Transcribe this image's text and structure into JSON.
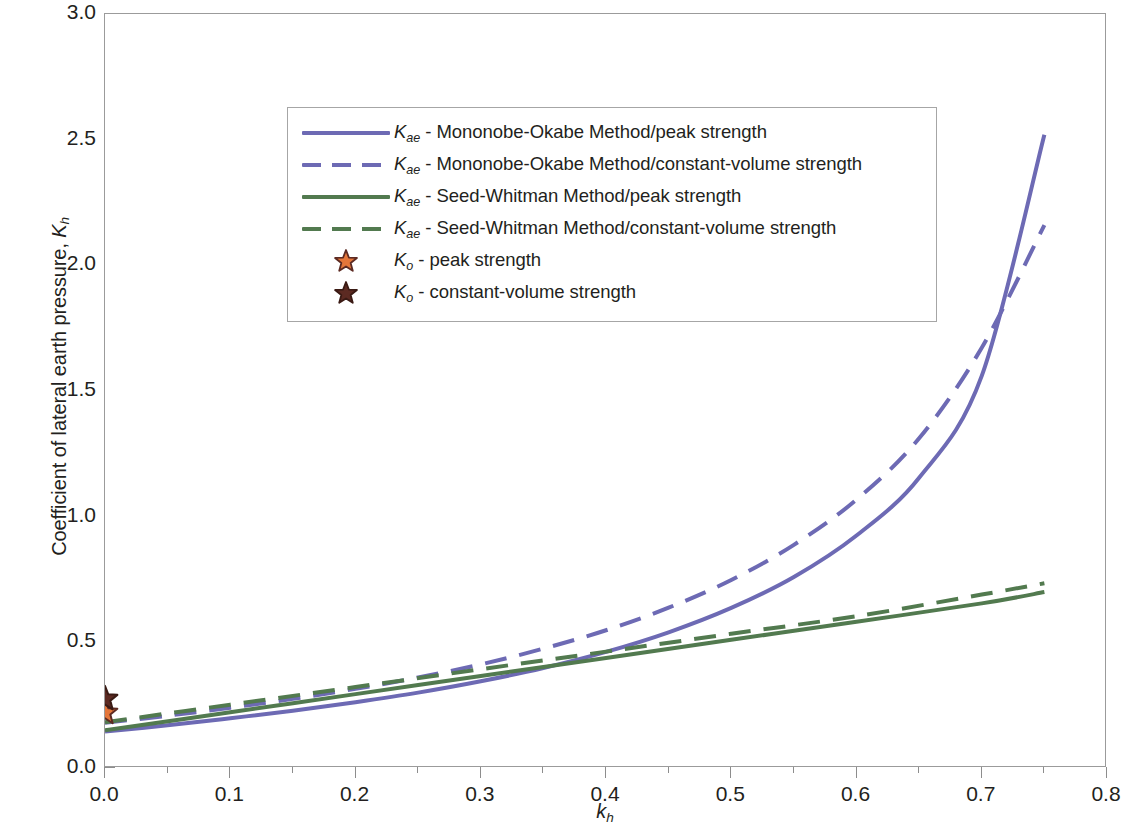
{
  "chart_data": {
    "type": "line",
    "title": "",
    "xlabel": "k_h",
    "ylabel": "Coefficient of lateral earth pressure, K_h",
    "xlim": [
      0.0,
      0.8
    ],
    "ylim": [
      0.0,
      3.0
    ],
    "x_ticks": [
      "0.0",
      "0.1",
      "0.2",
      "0.3",
      "0.4",
      "0.5",
      "0.6",
      "0.7",
      "0.8"
    ],
    "x_tick_values": [
      0.0,
      0.1,
      0.2,
      0.3,
      0.4,
      0.5,
      0.6,
      0.7,
      0.8
    ],
    "x_minor_step": 0.05,
    "y_ticks": [
      "0.0",
      "0.5",
      "1.0",
      "1.5",
      "2.0",
      "2.5",
      "3.0"
    ],
    "y_tick_values": [
      0.0,
      0.5,
      1.0,
      1.5,
      2.0,
      2.5,
      3.0
    ],
    "y_minor_step": 0.1,
    "grid": false,
    "legend_position": "upper-left-inside",
    "series": [
      {
        "name": "Kae - Mononobe-Okabe Method/peak strength",
        "style": "solid",
        "color": "#6d6ab4",
        "x": [
          0.0,
          0.05,
          0.1,
          0.15,
          0.2,
          0.25,
          0.3,
          0.35,
          0.4,
          0.45,
          0.5,
          0.55,
          0.6,
          0.65,
          0.7,
          0.75
        ],
        "y": [
          0.145,
          0.17,
          0.198,
          0.228,
          0.262,
          0.3,
          0.345,
          0.398,
          0.462,
          0.54,
          0.637,
          0.76,
          0.925,
          1.155,
          1.56,
          2.52
        ]
      },
      {
        "name": "Kae - Mononobe-Okabe Method/constant-volume strength",
        "style": "dashed",
        "color": "#6d6ab4",
        "x": [
          0.0,
          0.05,
          0.1,
          0.15,
          0.2,
          0.25,
          0.3,
          0.35,
          0.4,
          0.45,
          0.5,
          0.55,
          0.6,
          0.65,
          0.7,
          0.75
        ],
        "y": [
          0.18,
          0.208,
          0.24,
          0.275,
          0.315,
          0.36,
          0.412,
          0.475,
          0.548,
          0.638,
          0.748,
          0.888,
          1.068,
          1.312,
          1.672,
          2.16
        ]
      },
      {
        "name": "Kae - Seed-Whitman Method/peak strength",
        "style": "solid",
        "color": "#527a4f",
        "x": [
          0.0,
          0.1,
          0.2,
          0.3,
          0.4,
          0.5,
          0.6,
          0.7,
          0.75
        ],
        "y": [
          0.15,
          0.222,
          0.294,
          0.366,
          0.438,
          0.51,
          0.582,
          0.655,
          0.7
        ]
      },
      {
        "name": "Kae - Seed-Whitman Method/constant-volume strength",
        "style": "dashed",
        "color": "#527a4f",
        "x": [
          0.0,
          0.1,
          0.2,
          0.3,
          0.4,
          0.5,
          0.6,
          0.7,
          0.75
        ],
        "y": [
          0.182,
          0.252,
          0.322,
          0.393,
          0.463,
          0.534,
          0.604,
          0.69,
          0.735
        ]
      }
    ],
    "points": [
      {
        "name": "Ko - peak strength",
        "marker": "star",
        "fill": "#e4763a",
        "stroke": "#5c2a22",
        "x": 0.0,
        "y": 0.22
      },
      {
        "name": "Ko - constant-volume strength",
        "marker": "star",
        "fill": "#5c2a22",
        "stroke": "#3a1a14",
        "x": 0.0,
        "y": 0.275
      }
    ]
  },
  "axes": {
    "ylabel_prefix": "Coefficient of lateral earth pressure, ",
    "ylabel_symbol": "K",
    "ylabel_sub": "h",
    "xlabel_symbol": "k",
    "xlabel_sub": "h"
  },
  "legend": {
    "items": [
      {
        "sample": "line-solid-blue",
        "symbol": "K",
        "sub": "ae",
        "text": " - Mononobe-Okabe Method/peak strength",
        "color": "#6d6ab4",
        "style": "solid"
      },
      {
        "sample": "line-dashed-blue",
        "symbol": "K",
        "sub": "ae",
        "text": " - Mononobe-Okabe Method/constant-volume strength",
        "color": "#6d6ab4",
        "style": "dashed"
      },
      {
        "sample": "line-solid-green",
        "symbol": "K",
        "sub": "ae",
        "text": " - Seed-Whitman Method/peak strength",
        "color": "#527a4f",
        "style": "solid"
      },
      {
        "sample": "line-dashed-green",
        "symbol": "K",
        "sub": "ae",
        "text": " - Seed-Whitman Method/constant-volume strength",
        "color": "#527a4f",
        "style": "dashed"
      },
      {
        "sample": "star-orange",
        "symbol": "K",
        "sub": "o",
        "text": " - peak strength",
        "color": "#e4763a",
        "style": "star"
      },
      {
        "sample": "star-maroon",
        "symbol": "K",
        "sub": "o",
        "text": " - constant-volume strength",
        "color": "#5c2a22",
        "style": "star"
      }
    ]
  }
}
